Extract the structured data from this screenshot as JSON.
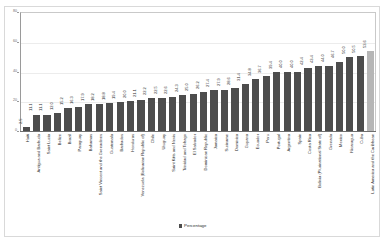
{
  "chart_data": {
    "type": "bar",
    "title": "",
    "subtitle": "",
    "xlabel": "",
    "ylabel": "",
    "ylim": [
      0,
      80
    ],
    "yticks": [
      0,
      20,
      40,
      60,
      80
    ],
    "grid": true,
    "legend_position": "bottom",
    "legend": [
      "Percentage"
    ],
    "series_color": "#4d4d4d",
    "highlight_color": "#b6b6b6",
    "highlight_category": "Latin America and the Caribbean",
    "categories": [
      "Haiti",
      "Antigua and Barbuda",
      "Saint Lucia",
      "Belize",
      "Brazil",
      "Paraguay",
      "Bahamas",
      "Saint Vincent and the Grenadines",
      "Guatemala",
      "Barbados",
      "Honduras",
      "Venezuela (Bolivarian Republic of)",
      "Chile",
      "Uruguay",
      "Saint Kitts and Nevis",
      "Trinidad and Tobago",
      "El Salvador",
      "Dominican Republic",
      "Jamaica",
      "Suriname",
      "Dominica",
      "Guyana",
      "Ecuador",
      "Peru",
      "Portugal",
      "Argentina",
      "Spain",
      "Costa Rica",
      "Bolivia (Plurinational State of)",
      "Grenada",
      "Mexico",
      "Nicaragua",
      "Cuba",
      "Latin America and the Caribbean"
    ],
    "values": [
      2.5,
      11.1,
      11.1,
      12.0,
      15.2,
      16.3,
      17.9,
      18.2,
      18.8,
      19.4,
      20.0,
      21.1,
      22.2,
      22.5,
      22.6,
      24.3,
      25.0,
      26.2,
      27.4,
      27.9,
      28.6,
      31.4,
      34.8,
      36.7,
      39.4,
      40.0,
      40.0,
      42.4,
      43.4,
      44.0,
      46.7,
      50.0,
      50.5,
      53.6
    ],
    "value_labels": [
      "2.5",
      "11.1",
      "11.1",
      "12.0",
      "15.2",
      "16.3",
      "17.9",
      "18.2",
      "18.8",
      "19.4",
      "20.0",
      "21.1",
      "22.2",
      "22.5",
      "22.6",
      "24.3",
      "25.0",
      "26.2",
      "27.4",
      "27.9",
      "28.6",
      "31.4",
      "34.8",
      "36.7",
      "39.4",
      "40.0",
      "40.0",
      "42.4",
      "43.4",
      "44.0",
      "46.7",
      "50.0",
      "50.5",
      "53.6"
    ]
  },
  "legend": {
    "label": "Percentage"
  },
  "axis": {
    "tick_80": "80",
    "tick_60": "60",
    "tick_40": "40",
    "tick_20": "20",
    "tick_0": "0"
  }
}
